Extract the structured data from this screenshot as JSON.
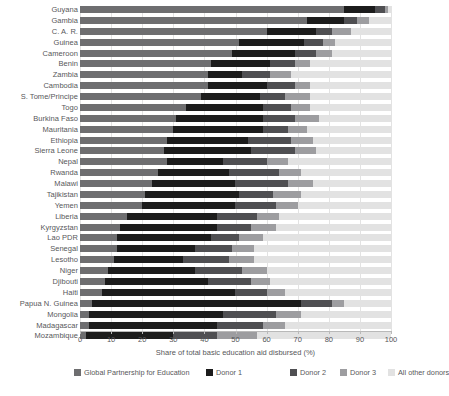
{
  "chart_data": {
    "type": "bar",
    "orientation": "horizontal",
    "stacked": true,
    "title": "",
    "xlabel": "Share of total basic education aid disbursed (%)",
    "ylabel": "",
    "xlim": [
      0,
      100
    ],
    "xticks": [
      0,
      10,
      20,
      30,
      40,
      50,
      60,
      70,
      80,
      90,
      100
    ],
    "grid": false,
    "legend_position": "bottom",
    "legend": [
      "Global Partnership for Education",
      "Donor 1",
      "Donor 2",
      "Donor 3",
      "All other donors"
    ],
    "colors": [
      "#6e6e70",
      "#1c1c1c",
      "#4f4f52",
      "#9d9da0",
      "#e2e2e2"
    ],
    "categories": [
      "Guyana",
      "Gambia",
      "C. A. R.",
      "Guinea",
      "Cameroon",
      "Benin",
      "Zambia",
      "Cambodia",
      "S. Tome/Principe",
      "Togo",
      "Burkina Faso",
      "Mauritania",
      "Ethiopia",
      "Sierra Leone",
      "Nepal",
      "Rwanda",
      "Malawi",
      "Tajikistan",
      "Yemen",
      "Liberia",
      "Kyrgyzstan",
      "Lao PDR",
      "Senegal",
      "Lesotho",
      "Niger",
      "Djibouti",
      "Haiti",
      "Papua N. Guinea",
      "Mongolia",
      "Madagascar",
      "Mozambique"
    ],
    "series": [
      {
        "name": "Global Partnership for Education",
        "values": [
          85,
          73,
          60,
          51,
          49,
          42,
          41,
          41,
          39,
          34,
          31,
          30,
          28,
          27,
          28,
          25,
          23,
          21,
          20,
          15,
          13,
          12,
          12,
          11,
          9,
          8,
          7,
          4,
          3,
          3,
          2
        ]
      },
      {
        "name": "Donor 1",
        "values": [
          10,
          12,
          16,
          21,
          20,
          19,
          11,
          19,
          19,
          25,
          28,
          29,
          26,
          28,
          18,
          23,
          27,
          30,
          30,
          29,
          31,
          30,
          25,
          22,
          28,
          33,
          43,
          67,
          43,
          41,
          28
        ]
      },
      {
        "name": "Donor 2",
        "values": [
          3,
          4,
          5,
          6,
          7,
          8,
          9,
          9,
          8,
          9,
          10,
          8,
          14,
          14,
          14,
          16,
          17,
          11,
          13,
          13,
          11,
          9,
          12,
          15,
          15,
          14,
          10,
          10,
          17,
          15,
          14
        ]
      },
      {
        "name": "Donor 3",
        "values": [
          1,
          4,
          6,
          4,
          5,
          5,
          7,
          5,
          8,
          6,
          8,
          6,
          7,
          7,
          7,
          7,
          8,
          9,
          7,
          7,
          8,
          8,
          7,
          8,
          8,
          6,
          6,
          4,
          8,
          7,
          13
        ]
      },
      {
        "name": "All other donors",
        "values": [
          1,
          7,
          13,
          18,
          19,
          26,
          32,
          26,
          26,
          26,
          23,
          27,
          25,
          24,
          33,
          29,
          25,
          29,
          30,
          36,
          37,
          41,
          44,
          44,
          40,
          39,
          34,
          15,
          29,
          34,
          43
        ]
      }
    ]
  }
}
